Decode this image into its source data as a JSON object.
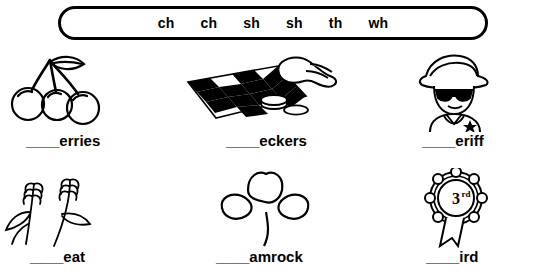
{
  "worksheet": {
    "word_bank": [
      "ch",
      "ch",
      "sh",
      "sh",
      "th",
      "wh"
    ],
    "items": [
      {
        "id": "cherries",
        "label": "____erries",
        "picture": "cherries-illustration"
      },
      {
        "id": "checkers",
        "label": "____eckers",
        "picture": "checkerboard-illustration"
      },
      {
        "id": "sheriff",
        "label": "____eriff",
        "picture": "sheriff-illustration"
      },
      {
        "id": "wheat",
        "label": "____eat",
        "picture": "wheat-illustration"
      },
      {
        "id": "shamrock",
        "label": "____amrock",
        "picture": "shamrock-illustration"
      },
      {
        "id": "third",
        "label": "____ird",
        "picture": "third-place-ribbon-illustration"
      }
    ]
  },
  "colors": {
    "ink": "#000000",
    "paper": "#ffffff"
  }
}
